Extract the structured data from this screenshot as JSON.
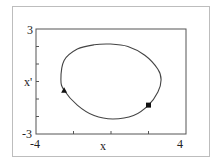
{
  "chart_data": {
    "type": "line",
    "title": "",
    "xlabel": "x",
    "ylabel": "x'",
    "xlim": [
      -4,
      4
    ],
    "ylim": [
      -3,
      3
    ],
    "x_tick_labels": [
      "-4",
      "4"
    ],
    "y_tick_labels": [
      "3",
      "-3"
    ],
    "grid": false,
    "legend": null,
    "series": [
      {
        "name": "phase-plane closed orbit",
        "points": [
          [
            -2.67,
            0.1
          ],
          [
            -2.5,
            1.2
          ],
          [
            -1.8,
            1.85
          ],
          [
            -0.9,
            2.1
          ],
          [
            -0.05,
            2.14
          ],
          [
            0.9,
            2.0
          ],
          [
            1.8,
            1.5
          ],
          [
            2.5,
            0.7
          ],
          [
            2.67,
            0.1
          ],
          [
            2.5,
            -0.6
          ],
          [
            2.0,
            -1.35
          ],
          [
            1.2,
            -1.95
          ],
          [
            0.1,
            -2.14
          ],
          [
            -0.9,
            -1.95
          ],
          [
            -1.8,
            -1.35
          ],
          [
            -2.5,
            -0.5
          ],
          [
            -2.67,
            0.1
          ]
        ]
      }
    ],
    "markers": [
      {
        "shape": "triangle",
        "x": -2.5,
        "y": -0.5
      },
      {
        "shape": "square",
        "x": 2.0,
        "y": -1.35
      }
    ]
  },
  "labels": {
    "x_axis": "x",
    "y_axis": "x'",
    "x_min": "-4",
    "x_max": "4",
    "y_max": "3",
    "y_min": "-3"
  }
}
